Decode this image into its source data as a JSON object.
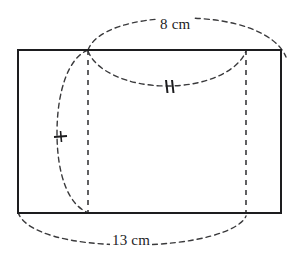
{
  "figure": {
    "stroke_color": "#1d1d1f",
    "dash_color": "#3a3a3c",
    "background": "#ffffff",
    "solid_stroke_width": 2.2,
    "dashed_stroke_width": 1.4,
    "rectangle": {
      "name": "main-rectangle",
      "x": 18,
      "y": 50,
      "width": 263,
      "height": 163
    },
    "dashed_vertical_lines": [
      {
        "name": "left-dashed-vertical",
        "x": 88,
        "y1": 50,
        "y2": 213
      },
      {
        "name": "right-dashed-vertical",
        "x": 246,
        "y1": 50,
        "y2": 213
      }
    ],
    "arcs": {
      "top_ellipse_upper": {
        "name": "top-ellipse-upper-arc",
        "cx": 185,
        "cy": 50,
        "rx": 97,
        "ry": 33
      },
      "top_ellipse_lower": {
        "name": "top-ellipse-lower-arc",
        "cx": 167,
        "cy": 50,
        "rx": 79,
        "ry": 36
      },
      "left_ellipse": {
        "name": "left-ellipse-arc",
        "cx": 88,
        "cy": 131,
        "rx": 31,
        "ry": 82
      },
      "bottom_ellipse": {
        "name": "bottom-ellipse-arc",
        "cx": 132,
        "cy": 213,
        "rx": 114,
        "ry": 31
      }
    },
    "tick_marks": [
      {
        "name": "double-tick-top-arc",
        "kind": "double",
        "x": 169,
        "y": 86,
        "angle_deg": 96,
        "length": 13,
        "gap": 4
      },
      {
        "name": "single-tick-left-arc",
        "kind": "single",
        "x": 61,
        "y": 136,
        "angle_deg": 4,
        "length": 13
      }
    ],
    "labels": {
      "top": {
        "name": "dimension-label-top",
        "text": "8 cm",
        "value": 8,
        "unit": "cm",
        "describes": "diameter of circular end (top ellipse)"
      },
      "bottom": {
        "name": "dimension-label-bottom",
        "text": "13 cm",
        "value": 13,
        "unit": "cm",
        "describes": "length of cylinder (bottom ellipse span)"
      }
    }
  }
}
